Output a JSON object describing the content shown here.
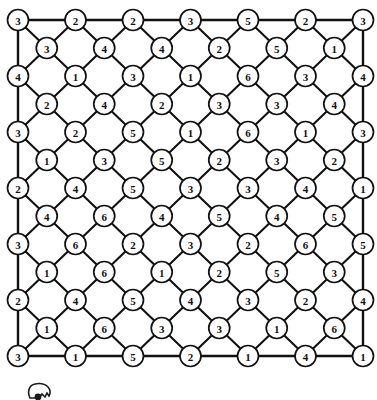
{
  "diagram": {
    "type": "lattice-graph",
    "width": 377,
    "height": 400,
    "colors": {
      "background": "#ffffff",
      "stroke": "#111111",
      "node_fill": "#ffffff",
      "label": "#111111"
    },
    "geometry": {
      "node_radius": 10.5,
      "major_row_count": 7,
      "minor_row_count": 6,
      "row_spacing": 28,
      "col_spacing": 57.5,
      "origin_x": 18,
      "origin_y": 20
    },
    "rows": [
      {
        "index": 0,
        "kind": "major",
        "y": 20,
        "values": [
          3,
          2,
          2,
          3,
          5,
          2,
          3
        ]
      },
      {
        "index": 1,
        "kind": "minor",
        "y": 48,
        "values": [
          3,
          4,
          4,
          2,
          5,
          1
        ]
      },
      {
        "index": 2,
        "kind": "major",
        "y": 76,
        "values": [
          4,
          1,
          3,
          1,
          6,
          3,
          4
        ]
      },
      {
        "index": 3,
        "kind": "minor",
        "y": 104,
        "values": [
          2,
          4,
          2,
          3,
          3,
          4
        ]
      },
      {
        "index": 4,
        "kind": "major",
        "y": 132,
        "values": [
          3,
          2,
          5,
          1,
          6,
          1,
          3
        ]
      },
      {
        "index": 5,
        "kind": "minor",
        "y": 160,
        "values": [
          1,
          3,
          5,
          2,
          3,
          2
        ]
      },
      {
        "index": 6,
        "kind": "major",
        "y": 188,
        "values": [
          2,
          4,
          5,
          3,
          3,
          4,
          1
        ]
      },
      {
        "index": 7,
        "kind": "minor",
        "y": 216,
        "values": [
          4,
          6,
          4,
          5,
          4,
          5
        ]
      },
      {
        "index": 8,
        "kind": "major",
        "y": 244,
        "values": [
          3,
          6,
          2,
          3,
          2,
          6,
          5
        ]
      },
      {
        "index": 9,
        "kind": "minor",
        "y": 272,
        "values": [
          1,
          6,
          1,
          2,
          5,
          3
        ]
      },
      {
        "index": 10,
        "kind": "major",
        "y": 300,
        "values": [
          2,
          4,
          5,
          4,
          3,
          2,
          4
        ]
      },
      {
        "index": 11,
        "kind": "minor",
        "y": 328,
        "values": [
          1,
          6,
          3,
          3,
          1,
          6
        ]
      },
      {
        "index": 12,
        "kind": "major",
        "y": 356,
        "values": [
          3,
          1,
          5,
          2,
          1,
          4,
          1
        ]
      }
    ],
    "border_edges": {
      "top": true,
      "bottom": true,
      "left": true,
      "right": true
    },
    "artifact": {
      "name": "cropped-glyph-fragment",
      "description": "partial cut-off mark at bottom-left"
    }
  }
}
